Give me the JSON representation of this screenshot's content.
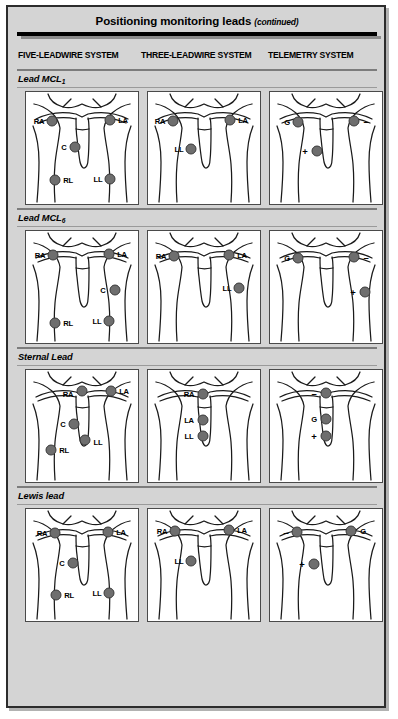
{
  "header": {
    "title": "Positioning monitoring leads",
    "continued": "(continued)"
  },
  "columns": [
    {
      "id": "five-leadwire",
      "label": "FIVE-LEADWIRE SYSTEM"
    },
    {
      "id": "three-leadwire",
      "label": "THREE-LEADWIRE SYSTEM"
    },
    {
      "id": "telemetry",
      "label": "TELEMETRY SYSTEM"
    }
  ],
  "colors": {
    "page_background": "#d4d4d4",
    "panel_background": "#ffffff",
    "electrode_fill": "#6e6e6e",
    "electrode_stroke": "#3a3a3a",
    "rule": "#7c7c7c",
    "border": "#2c2c2c"
  },
  "sections": [
    {
      "id": "lead-mcl1",
      "label": "Lead MCL",
      "subscript": "1",
      "panels": [
        {
          "system": "five-leadwire",
          "electrodes": [
            {
              "label": "RA",
              "x": 26,
              "y": 29,
              "label_dx": -13,
              "label_dy": 0
            },
            {
              "label": "LA",
              "x": 84,
              "y": 28,
              "label_dx": 13,
              "label_dy": 0
            },
            {
              "label": "C",
              "x": 49,
              "y": 55,
              "label_dx": -11,
              "label_dy": 0
            },
            {
              "label": "RL",
              "x": 29,
              "y": 88,
              "label_dx": 13,
              "label_dy": 0
            },
            {
              "label": "LL",
              "x": 84,
              "y": 87,
              "label_dx": -12,
              "label_dy": 0
            }
          ]
        },
        {
          "system": "three-leadwire",
          "electrodes": [
            {
              "label": "RA",
              "x": 25,
              "y": 29,
              "label_dx": -13,
              "label_dy": 0
            },
            {
              "label": "LA",
              "x": 82,
              "y": 28,
              "label_dx": 13,
              "label_dy": 0
            },
            {
              "label": "LL",
              "x": 43,
              "y": 57,
              "label_dx": -12,
              "label_dy": 0
            }
          ]
        },
        {
          "system": "telemetry",
          "electrodes": [
            {
              "label": "G",
              "x": 28,
              "y": 30,
              "label_dx": -11,
              "label_dy": 0
            },
            {
              "label": "–",
              "x": 84,
              "y": 29,
              "label_dx": 12,
              "label_dy": 0,
              "symbol": true
            },
            {
              "label": "+",
              "x": 47,
              "y": 59,
              "label_dx": -12,
              "label_dy": 0,
              "symbol": true
            }
          ]
        }
      ]
    },
    {
      "id": "lead-mcl6",
      "label": "Lead MCL",
      "subscript": "6",
      "panels": [
        {
          "system": "five-leadwire",
          "electrodes": [
            {
              "label": "RA",
              "x": 27,
              "y": 24,
              "label_dx": -13,
              "label_dy": 0
            },
            {
              "label": "LA",
              "x": 83,
              "y": 23,
              "label_dx": 13,
              "label_dy": 0
            },
            {
              "label": "C",
              "x": 89,
              "y": 59,
              "label_dx": -12,
              "label_dy": 0
            },
            {
              "label": "RL",
              "x": 29,
              "y": 92,
              "label_dx": 13,
              "label_dy": 0
            },
            {
              "label": "LL",
              "x": 83,
              "y": 90,
              "label_dx": -12,
              "label_dy": 0
            }
          ]
        },
        {
          "system": "three-leadwire",
          "electrodes": [
            {
              "label": "RA",
              "x": 26,
              "y": 25,
              "label_dx": -13,
              "label_dy": 0
            },
            {
              "label": "LA",
              "x": 81,
              "y": 24,
              "label_dx": 13,
              "label_dy": 0
            },
            {
              "label": "LL",
              "x": 91,
              "y": 57,
              "label_dx": -12,
              "label_dy": 0
            }
          ]
        },
        {
          "system": "telemetry",
          "electrodes": [
            {
              "label": "G",
              "x": 28,
              "y": 27,
              "label_dx": -11,
              "label_dy": 0
            },
            {
              "label": "–",
              "x": 84,
              "y": 26,
              "label_dx": 12,
              "label_dy": 0,
              "symbol": true
            },
            {
              "label": "+",
              "x": 95,
              "y": 61,
              "label_dx": -12,
              "label_dy": 0,
              "symbol": true
            }
          ]
        }
      ]
    },
    {
      "id": "sternal-lead",
      "label": "Sternal Lead",
      "subscript": "",
      "panels": [
        {
          "system": "five-leadwire",
          "electrodes": [
            {
              "label": "RA",
              "x": 56,
              "y": 21,
              "label_dx": -14,
              "label_dy": 3
            },
            {
              "label": "LA",
              "x": 85,
              "y": 21,
              "label_dx": 13,
              "label_dy": 0
            },
            {
              "label": "C",
              "x": 48,
              "y": 54,
              "label_dx": -11,
              "label_dy": 0
            },
            {
              "label": "LL",
              "x": 59,
              "y": 70,
              "label_dx": 13,
              "label_dy": 2
            },
            {
              "label": "RL",
              "x": 25,
              "y": 80,
              "label_dx": 13,
              "label_dy": 0
            }
          ]
        },
        {
          "system": "three-leadwire",
          "electrodes": [
            {
              "label": "RA",
              "x": 55,
              "y": 24,
              "label_dx": -14,
              "label_dy": 0
            },
            {
              "label": "LA",
              "x": 55,
              "y": 50,
              "label_dx": -14,
              "label_dy": 0
            },
            {
              "label": "LL",
              "x": 55,
              "y": 66,
              "label_dx": -14,
              "label_dy": 0
            }
          ]
        },
        {
          "system": "telemetry",
          "electrodes": [
            {
              "label": "–",
              "x": 56,
              "y": 23,
              "label_dx": -12,
              "label_dy": 0,
              "symbol": true
            },
            {
              "label": "G",
              "x": 56,
              "y": 49,
              "label_dx": -12,
              "label_dy": 0
            },
            {
              "label": "+",
              "x": 56,
              "y": 66,
              "label_dx": -12,
              "label_dy": 0,
              "symbol": true
            }
          ]
        }
      ]
    },
    {
      "id": "lewis-lead",
      "label": "Lewis lead",
      "subscript": "",
      "panels": [
        {
          "system": "five-leadwire",
          "electrodes": [
            {
              "label": "RA",
              "x": 29,
              "y": 24,
              "label_dx": -13,
              "label_dy": 0
            },
            {
              "label": "LA",
              "x": 82,
              "y": 23,
              "label_dx": 13,
              "label_dy": 0
            },
            {
              "label": "C",
              "x": 47,
              "y": 54,
              "label_dx": -11,
              "label_dy": 0
            },
            {
              "label": "RL",
              "x": 30,
              "y": 86,
              "label_dx": 13,
              "label_dy": 0
            },
            {
              "label": "LL",
              "x": 83,
              "y": 84,
              "label_dx": -12,
              "label_dy": 0
            }
          ]
        },
        {
          "system": "three-leadwire",
          "electrodes": [
            {
              "label": "RA",
              "x": 27,
              "y": 22,
              "label_dx": -13,
              "label_dy": 0
            },
            {
              "label": "LA",
              "x": 81,
              "y": 21,
              "label_dx": 13,
              "label_dy": 0
            },
            {
              "label": "LL",
              "x": 43,
              "y": 52,
              "label_dx": -12,
              "label_dy": 0
            }
          ]
        },
        {
          "system": "telemetry",
          "electrodes": [
            {
              "label": "–",
              "x": 27,
              "y": 23,
              "label_dx": -11,
              "label_dy": 0,
              "symbol": true
            },
            {
              "label": "G",
              "x": 81,
              "y": 22,
              "label_dx": 12,
              "label_dy": 0
            },
            {
              "label": "+",
              "x": 44,
              "y": 55,
              "label_dx": -12,
              "label_dy": 0,
              "symbol": true
            }
          ]
        }
      ]
    }
  ]
}
